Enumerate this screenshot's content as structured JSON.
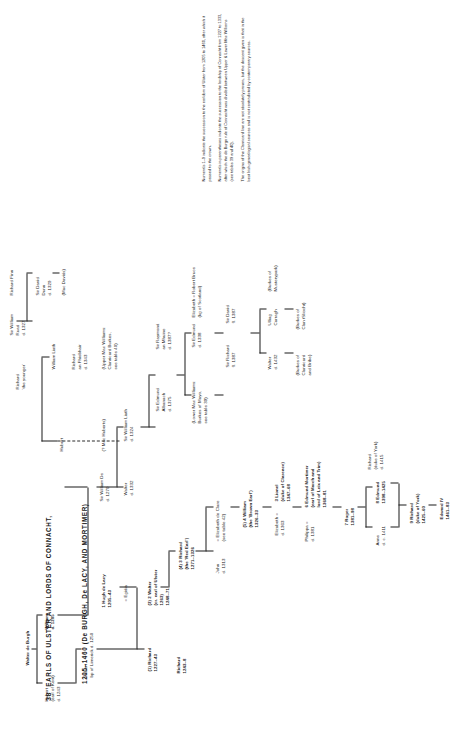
{
  "title": {
    "number": "38",
    "line1": "EARLS OF ULSTER AND LORDS OF CONNACHT,",
    "line2": "1205–1460 (De BURGH, De LACY, AND MORTIMER)"
  },
  "nodes": [
    {
      "id": "walter-de-burgh-top",
      "text": "Walter de Burgh"
    },
    {
      "id": "hubert-earl-kent",
      "text": "Hubert\n(earl of Kent)\nd. 1243"
    },
    {
      "id": "william-1205",
      "text": "William\nd. 1205"
    },
    {
      "id": "hubert-bp-limerick",
      "text": "Hubert\nbp of Limerick d. 1250"
    },
    {
      "id": "richard-1227-43",
      "text": "(1) Richard\n1227–43"
    },
    {
      "id": "hugh-de-lacy",
      "text": "1 Hugh de Lacy\n1205–43",
      "bold_first": true
    },
    {
      "id": "egidia",
      "text": "= Egidia"
    },
    {
      "id": "richard-1243-8",
      "text": "Richard\n1243–8"
    },
    {
      "id": "walter-earl-ulster",
      "text": "(3) 2 Walter\n(cr. earl of Ulster\n1263)\n1248–71"
    },
    {
      "id": "richard-red-earl",
      "text": "(4) 3 Richard\n(the 'Red Earl')\n1271–1326"
    },
    {
      "id": "john-de-burgh",
      "text": "John\nd. 1313"
    },
    {
      "id": "elizabeth-de-clare",
      "text": "= Elizabeth de Clare\n(see table 42)"
    },
    {
      "id": "william-brown-earl",
      "text": "(5) 4 William\n(the 'Brown Earl')\n1326–33"
    },
    {
      "id": "elizabeth-1363",
      "text": "Elizabeth =\nd. 1363"
    },
    {
      "id": "lionel-clarence",
      "text": "3 Lionel\n(duke of Clarence)\n1347–68"
    },
    {
      "id": "philippa-1381",
      "text": "Philippa =\nd. 1381"
    },
    {
      "id": "edmund-mortimer",
      "text": "6 Edmund Mortimer\n(earl of March and\nlord of Leix and Trim)\n1368–81"
    },
    {
      "id": "roger-1381-98",
      "text": "7 Roger\n1381–98"
    },
    {
      "id": "anne-1411",
      "text": "Anne\nd. c. 1411"
    },
    {
      "id": "edmund-1398-1425",
      "text": "8 Edmund\n1398–1425"
    },
    {
      "id": "richard-york-1415",
      "text": "Richard\n(duke of York)\nd. 1415"
    },
    {
      "id": "richard-duke-york",
      "text": "9 Richard\n(duke of York)\n1425–60"
    },
    {
      "id": "edward-iv",
      "text": "Edward IV\n1461–83"
    },
    {
      "id": "william-1205-main",
      "text": "William\nd. 1205"
    },
    {
      "id": "walter-de-burgh-col",
      "text": "Walter\nd. 1332"
    },
    {
      "id": "sir-william-de",
      "text": "Sir William De\nd. 1270"
    },
    {
      "id": "sir-william-liath",
      "text": "Sir William Liath\nd. 1324"
    },
    {
      "id": "sir-edmund-albanach",
      "text": "Sir Edmund\nAlbanach\nd. 1375"
    },
    {
      "id": "sir-raymond-mhuine",
      "text": "Sir Raymond\nan Mhuine\nd. 1387?"
    },
    {
      "id": "lower-mac-williams",
      "text": "(Lower Mac Williams:\nBurkes of Mayo,\nsee table 39)"
    },
    {
      "id": "sir-edmund-1338",
      "text": "Sir Edmund\nd. 1338"
    },
    {
      "id": "elizabeth-robert-bruce",
      "text": "Elizabeth = Robert Bruce\n(kg of Scotland)"
    },
    {
      "id": "sir-richard-1387",
      "text": "Sir Richard\nfl. 1387"
    },
    {
      "id": "sir-david-1387",
      "text": "Sir David\nfl. 1387"
    },
    {
      "id": "walter-1432",
      "text": "Walter\nd. 1432"
    },
    {
      "id": "ulliag-carragh",
      "text": "Ulliag\nCarragh"
    },
    {
      "id": "burkes-clanricard",
      "text": "(Burkes of\nClanricard\nand Bribe)"
    },
    {
      "id": "burkes-clan-sliocht",
      "text": "(Burkes of\nClan tSliocht)"
    },
    {
      "id": "burkes-mustearpark",
      "text": "(Burkes of\nMusterypark)"
    },
    {
      "id": "hubert-upper",
      "text": "Hubert"
    },
    {
      "id": "richard-younger",
      "text": "Richard\n'the younger'"
    },
    {
      "id": "william-liath-upper",
      "text": "William Liath"
    },
    {
      "id": "richard-fhiobhair",
      "text": "Richard\nan Fhiobhair\nd. 1343"
    },
    {
      "id": "upper-mac-williams",
      "text": "(Upper Mac Williams:\nClanricard Burkes,\nsee table 40)"
    },
    {
      "id": "mac-hubert",
      "text": "(? Mac Huberts)"
    },
    {
      "id": "richard-finn",
      "text": "Richard Finn"
    },
    {
      "id": "sir-david-dunn",
      "text": "Sir David\nDunn\nd. 1329"
    },
    {
      "id": "mac-davids",
      "text": "(Mac Davids)"
    },
    {
      "id": "sir-william-ruad",
      "text": "Sir William\nRuad\nd. 1327"
    }
  ],
  "notes": [
    "Numerals 1–9 indicate the succession to the earldom of Ulster from 1205 to 1460, after which it passed to the crown.",
    "Numerals in parentheses indicate the succession to the lordship of Connacht from 1227 to 1333, after which the de Burgo rule of Connacht was divided between Upper & Lower Mac Williams (see tables 39 and 40).",
    "The origins of the Clanricard line are not absolutely proven, but the descent given is that in the best Irish genealogical sources and is not contradicted by contemporary sources."
  ]
}
